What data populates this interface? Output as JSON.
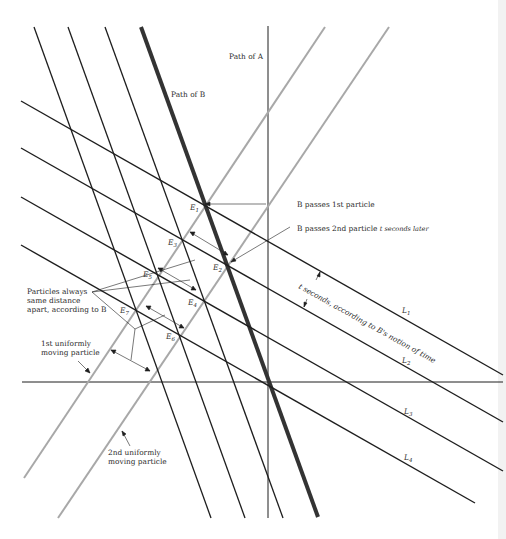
{
  "page": {
    "number_fragment": "5·3"
  },
  "labels": {
    "path_a": "Path of A",
    "path_b": "Path of B",
    "b_passes_1st": "B passes 1st particle",
    "b_passes_2nd": "B passes 2nd particle",
    "t_seconds_later": "t seconds later",
    "t_seconds_note": "t seconds, according to B's notion of time",
    "particles_note_1": "Particles always",
    "particles_note_2": "same distance",
    "particles_note_3": "apart, according to B",
    "first_particle_1": "1st uniformly",
    "first_particle_2": "moving particle",
    "second_particle_1": "2nd uniformly",
    "second_particle_2": "moving particle"
  },
  "events": [
    {
      "name": "E",
      "sub": "1"
    },
    {
      "name": "E",
      "sub": "2"
    },
    {
      "name": "E",
      "sub": "3"
    },
    {
      "name": "E",
      "sub": "4"
    },
    {
      "name": "E",
      "sub": "5"
    },
    {
      "name": "E",
      "sub": "6"
    },
    {
      "name": "E",
      "sub": "7"
    }
  ],
  "simultaneity_lines": [
    {
      "name": "L",
      "sub": "1"
    },
    {
      "name": "L",
      "sub": "2"
    },
    {
      "name": "L",
      "sub": "3"
    },
    {
      "name": "L",
      "sub": "4"
    }
  ],
  "colors": {
    "ink": "#1e1e1e",
    "path_b": "#333333",
    "particle": "#a8a8a8"
  }
}
